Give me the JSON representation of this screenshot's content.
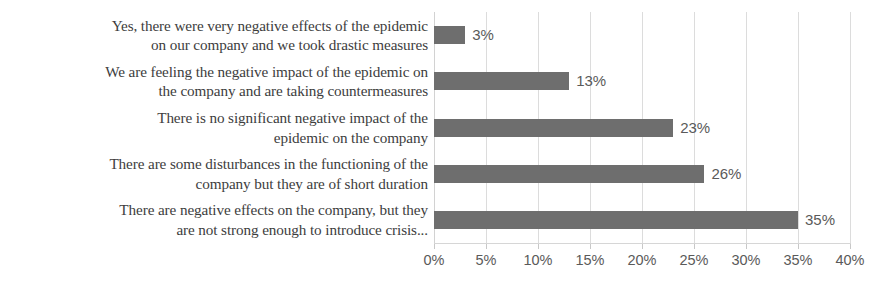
{
  "chart_data": {
    "type": "bar",
    "orientation": "horizontal",
    "title": "",
    "xlabel": "",
    "ylabel": "",
    "categories": [
      "Yes, there were very negative effects of the epidemic on our company and we took drastic measures",
      "We are feeling the negative impact of the epidemic on the company and are taking countermeasures",
      "There is no significant negative impact of the epidemic on the company",
      "There are some disturbances in the functioning of the company but they are of short duration",
      "There are negative effects on the company, but they are not strong enough to introduce crisis..."
    ],
    "category_lines": [
      [
        "Yes, there were very negative effects of the epidemic",
        "on our company and we took drastic measures"
      ],
      [
        "We are feeling the negative impact of the epidemic on",
        "the company and are taking countermeasures"
      ],
      [
        "There is no significant negative impact of the",
        "epidemic on the company"
      ],
      [
        "There are some disturbances in the functioning of the",
        "company but they are of short duration"
      ],
      [
        "There are negative effects on the company, but they",
        "are not strong enough to introduce crisis..."
      ]
    ],
    "values": [
      3,
      13,
      23,
      26,
      35
    ],
    "value_labels": [
      "3%",
      "13%",
      "23%",
      "26%",
      "35%"
    ],
    "xlim": [
      0,
      40
    ],
    "xticks": [
      0,
      5,
      10,
      15,
      20,
      25,
      30,
      35,
      40
    ],
    "xtick_labels": [
      "0%",
      "5%",
      "10%",
      "15%",
      "20%",
      "25%",
      "30%",
      "35%",
      "40%"
    ],
    "grid": true,
    "legend": false,
    "bar_color": "#6e6e6e",
    "gridline_color": "#dcdcdc",
    "label_color": "#3d3d3d",
    "value_label_color": "#5a5a5a",
    "background_color": "#ffffff"
  }
}
